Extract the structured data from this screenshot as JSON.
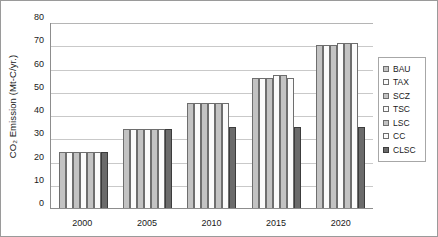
{
  "chart_data": {
    "type": "bar",
    "title": "",
    "xlabel": "",
    "ylabel": "CO₂ Emission (Mt-C/yr.)",
    "categories": [
      "2000",
      "2005",
      "2010",
      "2015",
      "2020"
    ],
    "ylim": [
      0,
      80
    ],
    "yticks": [
      0,
      10,
      20,
      30,
      40,
      50,
      60,
      70,
      80
    ],
    "grid": true,
    "legend_position": "right",
    "series": [
      {
        "name": "BAU",
        "fill": "#c3c3c3",
        "values": [
          24,
          34,
          45,
          56,
          70
        ]
      },
      {
        "name": "TAX",
        "fill": "#fbfbfb",
        "values": [
          24,
          34,
          45,
          56,
          70
        ]
      },
      {
        "name": "SCZ",
        "fill": "#c3c3c3",
        "values": [
          24,
          34,
          45,
          56,
          70
        ]
      },
      {
        "name": "TSC",
        "fill": "#fbfbfb",
        "values": [
          24,
          34,
          45,
          57,
          71
        ]
      },
      {
        "name": "LSC",
        "fill": "#c3c3c3",
        "values": [
          24,
          34,
          45,
          57,
          71
        ]
      },
      {
        "name": "CC",
        "fill": "#fbfbfb",
        "values": [
          24,
          34,
          45,
          56,
          71
        ]
      },
      {
        "name": "CLSC",
        "fill": "#6b6b6b",
        "values": [
          24,
          34,
          35,
          35,
          35
        ]
      }
    ]
  },
  "ytick_labels": [
    "80",
    "70",
    "60",
    "50",
    "40",
    "30",
    "20",
    "10",
    "0"
  ]
}
